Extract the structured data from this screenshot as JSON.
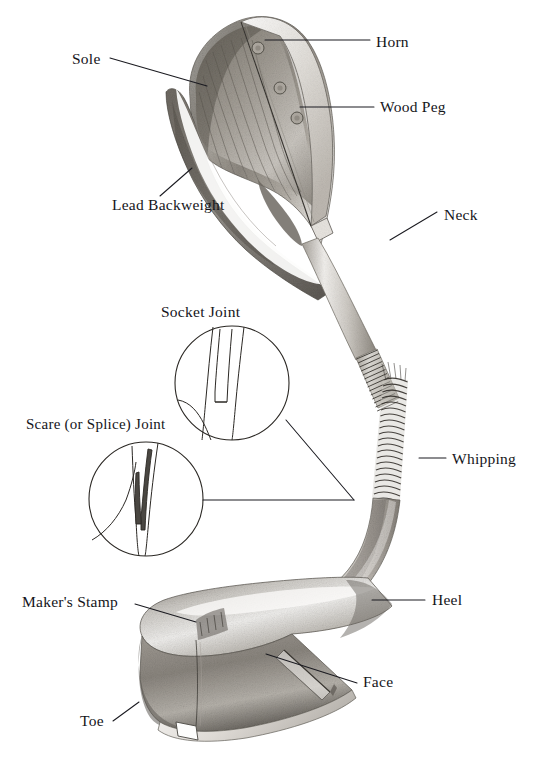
{
  "figure": {
    "ink_color": "#15151a",
    "line_color": "#1a1a20",
    "paper_color": "#ffffff"
  },
  "labels": {
    "horn": "Horn",
    "sole": "Sole",
    "wood_peg": "Wood Peg",
    "lead_backweight": "Lead Backweight",
    "neck": "Neck",
    "socket_joint": "Socket Joint",
    "scare_joint": "Scare (or Splice) Joint",
    "whipping": "Whipping",
    "makers_stamp": "Maker's Stamp",
    "heel": "Heel",
    "face": "Face",
    "toe": "Toe"
  },
  "detail_circles": [
    {
      "name": "socket-joint-detail",
      "caption": "Socket Joint",
      "cx": 232,
      "cy": 383,
      "r": 57
    },
    {
      "name": "scare-joint-detail",
      "caption": "Scare (or Splice) Joint",
      "cx": 146,
      "cy": 499,
      "r": 57
    }
  ],
  "callouts": [
    {
      "name": "horn",
      "text": "Horn",
      "text_x": 376,
      "text_y": 48,
      "line": [
        265,
        40,
        370,
        40
      ]
    },
    {
      "name": "sole",
      "text": "Sole",
      "text_x": 73,
      "text_y": 66,
      "line": [
        110,
        58,
        207,
        86
      ]
    },
    {
      "name": "wood-peg",
      "text": "Wood Peg",
      "text_x": 380,
      "text_y": 113,
      "line": [
        300,
        107,
        374,
        107
      ]
    },
    {
      "name": "lead-backweight",
      "text": "Lead Backweight",
      "text_x": 112,
      "text_y": 211,
      "line": [
        160,
        196,
        192,
        168
      ]
    },
    {
      "name": "neck",
      "text": "Neck",
      "text_x": 444,
      "text_y": 221,
      "line": [
        390,
        240,
        437,
        212
      ]
    },
    {
      "name": "whipping",
      "text": "Whipping",
      "text_x": 452,
      "text_y": 465,
      "line": [
        419,
        458,
        446,
        458
      ]
    },
    {
      "name": "makers-stamp",
      "text": "Maker's Stamp",
      "text_x": 22,
      "text_y": 608,
      "line": [
        135,
        604,
        196,
        622
      ]
    },
    {
      "name": "heel",
      "text": "Heel",
      "text_x": 432,
      "text_y": 606,
      "line": [
        372,
        600,
        425,
        600
      ]
    },
    {
      "name": "face",
      "text": "Face",
      "text_x": 363,
      "text_y": 688,
      "line": [
        266,
        654,
        357,
        683
      ]
    },
    {
      "name": "toe",
      "text": "Toe",
      "text_x": 80,
      "text_y": 727,
      "line": [
        113,
        721,
        139,
        702
      ]
    }
  ],
  "joint_leader_lines": [
    {
      "name": "socket-joint-leader",
      "from": [
        286,
        420
      ],
      "to": [
        354,
        500
      ]
    },
    {
      "name": "scare-joint-leader",
      "from": [
        203,
        500
      ],
      "to": [
        354,
        500
      ]
    }
  ],
  "wood_pegs": [
    {
      "cx": 243,
      "cy": 52,
      "r": 5.5
    },
    {
      "cx": 266,
      "cy": 89,
      "r": 5.5
    },
    {
      "cx": 290,
      "cy": 117,
      "r": 5.5
    }
  ],
  "parts": [
    {
      "key": "horn",
      "description": "horn insert strip along the leading sole edge"
    },
    {
      "key": "sole",
      "description": "underside of the club head"
    },
    {
      "key": "wood_peg",
      "description": "pegs pinning the horn to the head"
    },
    {
      "key": "lead_backweight",
      "description": "lead weight set into the back of the head"
    },
    {
      "key": "neck",
      "description": "tapering section joining head to shaft"
    },
    {
      "key": "whipping",
      "description": "thread binding over the joint"
    },
    {
      "key": "makers_stamp",
      "description": "stamped maker's mark on the crown"
    },
    {
      "key": "heel",
      "description": "end of head nearest the shaft"
    },
    {
      "key": "face",
      "description": "striking surface of the head"
    },
    {
      "key": "toe",
      "description": "end of head farthest from the shaft"
    }
  ]
}
